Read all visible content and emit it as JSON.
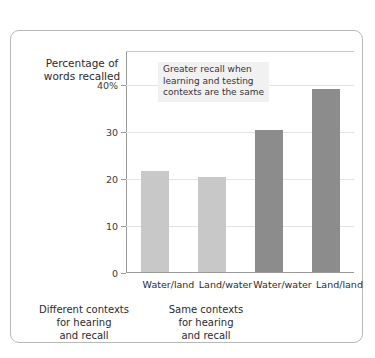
{
  "chart_data": {
    "type": "bar",
    "title": "",
    "xlabel": "",
    "ylabel": "Percentage of\nwords recalled",
    "categories": [
      "Water/land",
      "Land/water",
      "Water/water",
      "Land/land"
    ],
    "values": [
      21.5,
      20.3,
      30.2,
      39.0
    ],
    "bar_styles": [
      "light",
      "light",
      "dark",
      "dark"
    ],
    "ylim": [
      0,
      47
    ],
    "yticks": [
      0,
      10,
      20,
      30,
      40
    ],
    "ytick_labels": [
      "0",
      "10",
      "20",
      "30",
      "40%"
    ],
    "grid": true,
    "legend": "none",
    "annotations": [
      {
        "text": "Greater recall when\nlearning and testing\ncontexts are the same"
      }
    ],
    "group_labels": [
      "Different contexts\nfor hearing\nand recall",
      "Same contexts\nfor hearing\nand recall"
    ],
    "colors": {
      "bar_light": "#c8c8c8",
      "bar_dark": "#8c8c8c",
      "gridline": "#e2e2e2",
      "axis": "#9a9a9a",
      "frame": "#b9b9b9",
      "annotation_bg": "#f1f1f1",
      "text": "#2b2b2b"
    }
  }
}
